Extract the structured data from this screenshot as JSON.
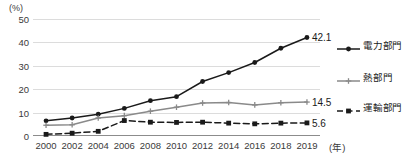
{
  "axis": {
    "unit_top": "(%)",
    "unit_x": "(年)",
    "y_ticks": [
      "50",
      "40",
      "30",
      "20",
      "10",
      "0"
    ],
    "x_ticks": [
      "2000",
      "2002",
      "2004",
      "2006",
      "2008",
      "2010",
      "2012",
      "2014",
      "2016",
      "2018",
      "2019"
    ]
  },
  "legend": {
    "items": [
      {
        "label": "電力部門",
        "marker": "circle-marker",
        "style": "solid",
        "color": "#1a1a1a"
      },
      {
        "label": "熱部門",
        "marker": "plus-marker",
        "style": "solid",
        "color": "#8a8a8a"
      },
      {
        "label": "運輸部門",
        "marker": "square-marker",
        "style": "dashed",
        "color": "#1a1a1a"
      }
    ]
  },
  "end_labels": {
    "power": "42.1",
    "heat": "14.5",
    "transport": "5.6"
  },
  "colors": {
    "power": "#1a1a1a",
    "heat": "#8a8a8a",
    "transport": "#1a1a1a",
    "grid": "#dcdcdc",
    "axis": "#8c8c8c",
    "text": "#3a3a3a"
  },
  "chart_data": {
    "type": "line",
    "title": "",
    "xlabel": "(年)",
    "ylabel": "(%)",
    "ylim": [
      0,
      50
    ],
    "grid": true,
    "legend_position": "right",
    "x": [
      "2000",
      "2002",
      "2004",
      "2006",
      "2008",
      "2010",
      "2012",
      "2014",
      "2016",
      "2018",
      "2019"
    ],
    "series": [
      {
        "name": "電力部門",
        "marker": "circle",
        "linestyle": "solid",
        "color": "#1a1a1a",
        "end_label": "42.1",
        "values": [
          6.5,
          7.7,
          9.3,
          11.8,
          15.1,
          16.8,
          23.3,
          27.1,
          31.4,
          37.5,
          42.1
        ]
      },
      {
        "name": "熱部門",
        "marker": "plus",
        "linestyle": "solid",
        "color": "#8a8a8a",
        "end_label": "14.5",
        "values": [
          4.6,
          4.8,
          7.7,
          8.7,
          10.6,
          12.3,
          14.1,
          14.3,
          13.3,
          14.2,
          14.5
        ]
      },
      {
        "name": "運輸部門",
        "marker": "square",
        "linestyle": "dashed",
        "color": "#1a1a1a",
        "end_label": "5.6",
        "values": [
          0.7,
          1.2,
          2.0,
          6.6,
          5.9,
          5.8,
          5.9,
          5.5,
          5.2,
          5.5,
          5.6
        ]
      }
    ]
  }
}
